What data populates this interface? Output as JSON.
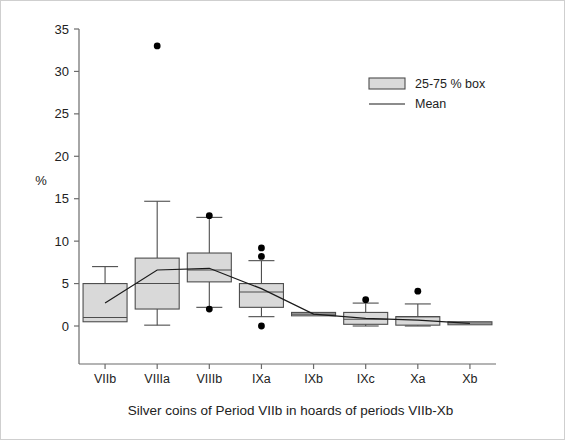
{
  "chart_data": {
    "type": "box",
    "title": "",
    "caption": "Silver coins of Period VIIb in hoards of periods VIIb-Xb",
    "xlabel": "",
    "ylabel": "%",
    "categories": [
      "VIIb",
      "VIIIa",
      "VIIIb",
      "IXa",
      "IXb",
      "IXc",
      "Xa",
      "Xb"
    ],
    "ylim": [
      0,
      35
    ],
    "yticks": [
      0,
      5,
      10,
      15,
      20,
      25,
      30,
      35
    ],
    "ytick_labels": [
      "0",
      "5",
      "10",
      "15",
      "20",
      "25",
      "30",
      "35"
    ],
    "grid": false,
    "legend": {
      "position": "top-right",
      "entries": [
        {
          "label": "25-75 % box",
          "marker": "box",
          "fill": "#d9d9d9",
          "stroke": "#4d4d4d"
        },
        {
          "label": "Mean",
          "marker": "line",
          "stroke": "#1a1a1a"
        }
      ]
    },
    "boxes": [
      {
        "category": "VIIb",
        "whisker_low": 0.5,
        "q1": 0.5,
        "median": 1.0,
        "q3": 5.0,
        "whisker_high": 7.0,
        "mean": 2.7,
        "outliers": []
      },
      {
        "category": "VIIIa",
        "whisker_low": 0.1,
        "q1": 2.0,
        "median": 5.0,
        "q3": 8.0,
        "whisker_high": 14.7,
        "mean": 6.6,
        "outliers": [
          33.0
        ]
      },
      {
        "category": "VIIIb",
        "whisker_low": 2.2,
        "q1": 5.2,
        "median": 6.6,
        "q3": 8.6,
        "whisker_high": 12.8,
        "mean": 6.8,
        "outliers": [
          13.0,
          2.0
        ]
      },
      {
        "category": "IXa",
        "whisker_low": 1.1,
        "q1": 2.2,
        "median": 4.0,
        "q3": 5.0,
        "whisker_high": 7.7,
        "mean": 4.4,
        "outliers": [
          9.2,
          8.2,
          0.0
        ]
      },
      {
        "category": "IXb",
        "whisker_low": 1.2,
        "q1": 1.2,
        "median": 1.4,
        "q3": 1.6,
        "whisker_high": 1.6,
        "mean": 1.4,
        "outliers": []
      },
      {
        "category": "IXc",
        "whisker_low": 0.0,
        "q1": 0.2,
        "median": 0.8,
        "q3": 1.6,
        "whisker_high": 2.7,
        "mean": 0.9,
        "outliers": [
          3.1
        ]
      },
      {
        "category": "Xa",
        "whisker_low": 0.0,
        "q1": 0.1,
        "median": 1.1,
        "q3": 1.1,
        "whisker_high": 2.6,
        "mean": 0.7,
        "outliers": [
          4.1
        ]
      },
      {
        "category": "Xb",
        "whisker_low": 0.2,
        "q1": 0.2,
        "median": 0.35,
        "q3": 0.5,
        "whisker_high": 0.5,
        "mean": 0.3,
        "outliers": []
      }
    ],
    "mean_series": {
      "name": "Mean",
      "values": [
        2.7,
        6.6,
        6.8,
        4.4,
        1.4,
        0.9,
        0.7,
        0.3
      ]
    },
    "colors": {
      "box_fill": "#d9d9d9",
      "box_stroke": "#4d4d4d",
      "axis": "#6b6b6b",
      "mean_line": "#1a1a1a",
      "outlier": "#000000",
      "text": "#222222"
    }
  }
}
